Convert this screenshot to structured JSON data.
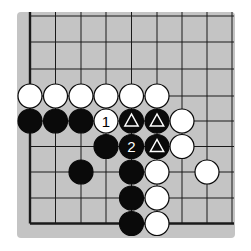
{
  "diagram": {
    "board_color": "#c4c4c4",
    "line_color": "#1a1a1a",
    "black_color": "#0a0a0a",
    "white_color": "#ffffff",
    "grid": {
      "columns_x": [
        30,
        55.5,
        81,
        106,
        131.5,
        157,
        182,
        207,
        232
      ],
      "rows_y": [
        16,
        42,
        69,
        96,
        121,
        146.5,
        172,
        198,
        223.5
      ],
      "edge_left": true,
      "edge_bottom": true,
      "stone_radius": 12
    },
    "stones": [
      {
        "color": "white",
        "col": 0,
        "row": 3,
        "label": "",
        "mark": ""
      },
      {
        "color": "white",
        "col": 1,
        "row": 3,
        "label": "",
        "mark": ""
      },
      {
        "color": "white",
        "col": 2,
        "row": 3,
        "label": "",
        "mark": ""
      },
      {
        "color": "white",
        "col": 3,
        "row": 3,
        "label": "",
        "mark": ""
      },
      {
        "color": "white",
        "col": 4,
        "row": 3,
        "label": "",
        "mark": ""
      },
      {
        "color": "white",
        "col": 5,
        "row": 3,
        "label": "",
        "mark": ""
      },
      {
        "color": "black",
        "col": 0,
        "row": 4,
        "label": "",
        "mark": ""
      },
      {
        "color": "black",
        "col": 1,
        "row": 4,
        "label": "",
        "mark": ""
      },
      {
        "color": "black",
        "col": 2,
        "row": 4,
        "label": "",
        "mark": ""
      },
      {
        "color": "white",
        "col": 3,
        "row": 4,
        "label": "1",
        "mark": ""
      },
      {
        "color": "black",
        "col": 4,
        "row": 4,
        "label": "",
        "mark": "triangle"
      },
      {
        "color": "black",
        "col": 5,
        "row": 4,
        "label": "",
        "mark": "triangle"
      },
      {
        "color": "white",
        "col": 6,
        "row": 4,
        "label": "",
        "mark": ""
      },
      {
        "color": "black",
        "col": 3,
        "row": 5,
        "label": "",
        "mark": ""
      },
      {
        "color": "black",
        "col": 4,
        "row": 5,
        "label": "2",
        "mark": ""
      },
      {
        "color": "black",
        "col": 5,
        "row": 5,
        "label": "",
        "mark": "triangle"
      },
      {
        "color": "white",
        "col": 6,
        "row": 5,
        "label": "",
        "mark": ""
      },
      {
        "color": "black",
        "col": 2,
        "row": 6,
        "label": "",
        "mark": ""
      },
      {
        "color": "black",
        "col": 4,
        "row": 6,
        "label": "",
        "mark": ""
      },
      {
        "color": "white",
        "col": 5,
        "row": 6,
        "label": "",
        "mark": ""
      },
      {
        "color": "white",
        "col": 7,
        "row": 6,
        "label": "",
        "mark": ""
      },
      {
        "color": "black",
        "col": 4,
        "row": 7,
        "label": "",
        "mark": ""
      },
      {
        "color": "white",
        "col": 5,
        "row": 7,
        "label": "",
        "mark": ""
      },
      {
        "color": "black",
        "col": 4,
        "row": 8,
        "label": "",
        "mark": ""
      },
      {
        "color": "white",
        "col": 5,
        "row": 8,
        "label": "",
        "mark": ""
      }
    ],
    "move_labels": [
      "1",
      "2"
    ]
  }
}
